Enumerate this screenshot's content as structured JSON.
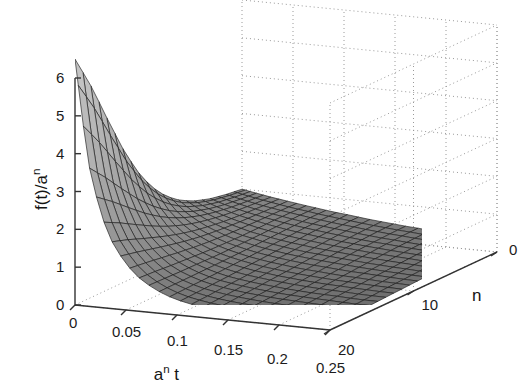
{
  "figure": {
    "background_color": "#ffffff",
    "axis_color": "#333333",
    "grid_color": "#9a9a9a",
    "mesh_line_color": "#1e1e1e",
    "surface_light": "#b9b9b9",
    "surface_dark": "#6d6d6d"
  },
  "axes": {
    "x": {
      "label_html": "a<sup>n</sup> t",
      "label_text": "a^n t",
      "ticks": [
        "0",
        "0.05",
        "0.1",
        "0.15",
        "0.2",
        "0.25"
      ],
      "tick_values": [
        0,
        0.05,
        0.1,
        0.15,
        0.2,
        0.25
      ],
      "range": [
        0,
        0.25
      ]
    },
    "y": {
      "label_html": "n",
      "label_text": "n",
      "ticks": [
        "0",
        "10",
        "20"
      ],
      "tick_values": [
        0,
        10,
        20
      ],
      "range": [
        0,
        20
      ]
    },
    "z": {
      "label_html": "f(t)/a<sup>n</sup>",
      "label_text": "f(t)/a^n",
      "ticks": [
        "0",
        "1",
        "2",
        "3",
        "4",
        "5",
        "6"
      ],
      "tick_values": [
        0,
        1,
        2,
        3,
        4,
        5,
        6
      ],
      "range": [
        0,
        6.5
      ]
    }
  },
  "chart_data": {
    "type": "surface",
    "title": "",
    "xlabel": "a^n t",
    "ylabel": "n",
    "zlabel": "f(t)/a^n",
    "xlim": [
      0,
      0.25
    ],
    "ylim": [
      0,
      20
    ],
    "zlim": [
      0,
      6.5
    ],
    "grid": true,
    "legend": "none",
    "colormap": "gray",
    "shading": "mesh-faceted",
    "x": [
      0,
      0.0125,
      0.025,
      0.0375,
      0.05,
      0.0625,
      0.075,
      0.0875,
      0.1,
      0.1125,
      0.125,
      0.1375,
      0.15,
      0.1625,
      0.175,
      0.1875,
      0.2,
      0.2125,
      0.225,
      0.2375,
      0.25
    ],
    "y": [
      0,
      1,
      2,
      3,
      4,
      5,
      6,
      7,
      8,
      9,
      10,
      11,
      12,
      13,
      14,
      15,
      16,
      17,
      18,
      19,
      20
    ],
    "peak": {
      "x": 0.0,
      "y": 20,
      "z": 6.5
    },
    "series": [
      {
        "n": 0,
        "values": [
          1.0,
          0.94,
          0.88,
          0.83,
          0.78,
          0.73,
          0.69,
          0.64,
          0.61,
          0.57,
          0.53,
          0.5,
          0.47,
          0.44,
          0.42,
          0.39,
          0.37,
          0.34,
          0.32,
          0.3,
          0.29
        ]
      },
      {
        "n": 2,
        "values": [
          1.06,
          0.98,
          0.91,
          0.85,
          0.79,
          0.74,
          0.69,
          0.64,
          0.6,
          0.56,
          0.53,
          0.49,
          0.46,
          0.43,
          0.41,
          0.38,
          0.36,
          0.33,
          0.31,
          0.29,
          0.28
        ]
      },
      {
        "n": 4,
        "values": [
          1.15,
          1.04,
          0.95,
          0.87,
          0.8,
          0.74,
          0.68,
          0.63,
          0.59,
          0.55,
          0.51,
          0.47,
          0.44,
          0.41,
          0.39,
          0.36,
          0.34,
          0.32,
          0.3,
          0.28,
          0.26
        ]
      },
      {
        "n": 6,
        "values": [
          1.3,
          1.14,
          1.01,
          0.9,
          0.81,
          0.73,
          0.67,
          0.61,
          0.56,
          0.52,
          0.48,
          0.45,
          0.42,
          0.39,
          0.36,
          0.34,
          0.32,
          0.3,
          0.28,
          0.26,
          0.25
        ]
      },
      {
        "n": 8,
        "values": [
          1.55,
          1.29,
          1.1,
          0.95,
          0.83,
          0.73,
          0.66,
          0.59,
          0.54,
          0.49,
          0.45,
          0.42,
          0.39,
          0.36,
          0.34,
          0.31,
          0.29,
          0.27,
          0.26,
          0.24,
          0.23
        ]
      },
      {
        "n": 10,
        "values": [
          1.95,
          1.52,
          1.23,
          1.02,
          0.86,
          0.74,
          0.65,
          0.57,
          0.51,
          0.46,
          0.42,
          0.38,
          0.35,
          0.33,
          0.3,
          0.28,
          0.27,
          0.25,
          0.23,
          0.22,
          0.21
        ]
      },
      {
        "n": 12,
        "values": [
          2.55,
          1.85,
          1.41,
          1.12,
          0.91,
          0.76,
          0.64,
          0.56,
          0.49,
          0.43,
          0.39,
          0.35,
          0.32,
          0.29,
          0.27,
          0.25,
          0.24,
          0.22,
          0.21,
          0.2,
          0.19
        ]
      },
      {
        "n": 14,
        "values": [
          3.4,
          2.28,
          1.65,
          1.25,
          0.98,
          0.79,
          0.65,
          0.54,
          0.46,
          0.4,
          0.36,
          0.32,
          0.29,
          0.26,
          0.24,
          0.22,
          0.21,
          0.2,
          0.18,
          0.17,
          0.17
        ]
      },
      {
        "n": 16,
        "values": [
          4.45,
          2.8,
          1.93,
          1.4,
          1.06,
          0.82,
          0.65,
          0.53,
          0.44,
          0.38,
          0.33,
          0.29,
          0.26,
          0.23,
          0.21,
          0.2,
          0.18,
          0.17,
          0.16,
          0.15,
          0.15
        ]
      },
      {
        "n": 18,
        "values": [
          5.55,
          3.35,
          2.22,
          1.56,
          1.14,
          0.86,
          0.66,
          0.52,
          0.42,
          0.35,
          0.3,
          0.26,
          0.23,
          0.21,
          0.19,
          0.17,
          0.16,
          0.15,
          0.14,
          0.13,
          0.13
        ]
      },
      {
        "n": 20,
        "values": [
          6.5,
          3.85,
          2.48,
          1.7,
          1.21,
          0.89,
          0.67,
          0.51,
          0.4,
          0.33,
          0.27,
          0.23,
          0.2,
          0.18,
          0.17,
          0.15,
          0.14,
          0.13,
          0.12,
          0.12,
          0.11
        ]
      }
    ]
  }
}
